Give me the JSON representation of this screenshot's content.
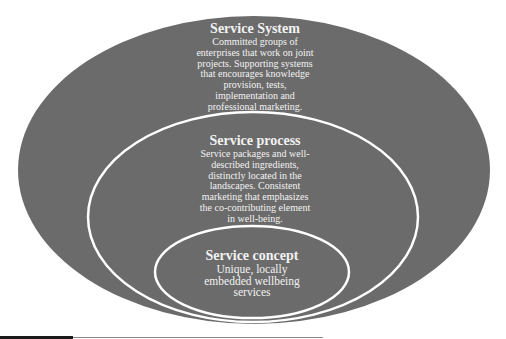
{
  "diagram": {
    "type": "nested-ellipses",
    "colors": {
      "fill": "#6b6b6b",
      "outline": "#ffffff",
      "text": "#f2f2f2"
    },
    "layers": [
      {
        "id": "service-system",
        "title": "Service System",
        "lines": [
          "Committed groups of",
          "enterprises that work on joint",
          "projects. Supporting systems",
          "that encourages knowledge",
          "provision, tests,",
          "implementation and",
          "professional marketing."
        ]
      },
      {
        "id": "service-process",
        "title": "Service process",
        "lines": [
          "Service packages and well-",
          "described ingredients,",
          "distinctly located in the",
          "landscapes. Consistent",
          "marketing that emphasizes",
          "the co-contributing element",
          "in well-being."
        ]
      },
      {
        "id": "service-concept",
        "title": "Service concept",
        "lines": [
          "Unique, locally",
          "embedded wellbeing",
          "services"
        ]
      }
    ]
  }
}
